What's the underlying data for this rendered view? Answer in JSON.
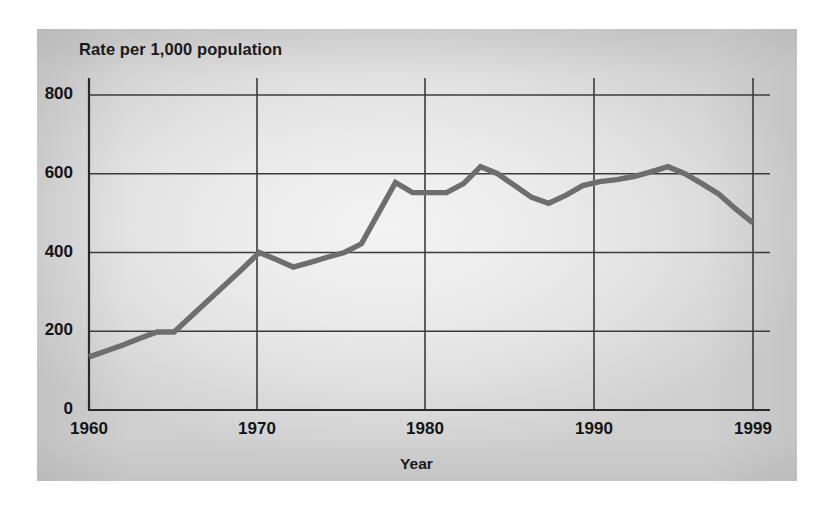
{
  "figure": {
    "title": "Rate per 1,000 population",
    "xlabel": "Year",
    "yticks": [
      "800",
      "600",
      "400",
      "200",
      "0"
    ],
    "xticks": [
      "1960",
      "1970",
      "1980",
      "1990",
      "1999"
    ],
    "line_color": "#6e6e6e",
    "grid_color": "#3b3b3b",
    "axis_color": "#2a2a2a",
    "plate_color": "#e6e6e6"
  },
  "chart_data": {
    "type": "line",
    "title": "Rate per 1,000 population",
    "subtitle": "",
    "xlabel": "Year",
    "ylabel": "Rate per 1,000 population",
    "xlim": [
      1960,
      1999
    ],
    "ylim": [
      0,
      800
    ],
    "yticks": [
      0,
      200,
      400,
      600,
      800
    ],
    "xticks": [
      1960,
      1970,
      1980,
      1990,
      1999
    ],
    "grid": true,
    "legend": "none",
    "series": [
      {
        "name": "Rate per 1,000 population",
        "color": "#6e6e6e",
        "x": [
          1960,
          1961,
          1962,
          1963,
          1964,
          1965,
          1966,
          1967,
          1968,
          1969,
          1970,
          1971,
          1972,
          1973,
          1974,
          1975,
          1976,
          1977,
          1978,
          1979,
          1980,
          1981,
          1982,
          1983,
          1984,
          1985,
          1986,
          1987,
          1988,
          1989,
          1990,
          1991,
          1992,
          1993,
          1994,
          1995,
          1996,
          1997,
          1998,
          1999
        ],
        "values": [
          135,
          150,
          165,
          182,
          198,
          198,
          238,
          278,
          318,
          358,
          400,
          382,
          363,
          375,
          388,
          400,
          422,
          500,
          578,
          552,
          552,
          552,
          575,
          618,
          600,
          570,
          540,
          525,
          545,
          570,
          580,
          585,
          593,
          605,
          618,
          600,
          575,
          548,
          510,
          475
        ]
      }
    ]
  }
}
